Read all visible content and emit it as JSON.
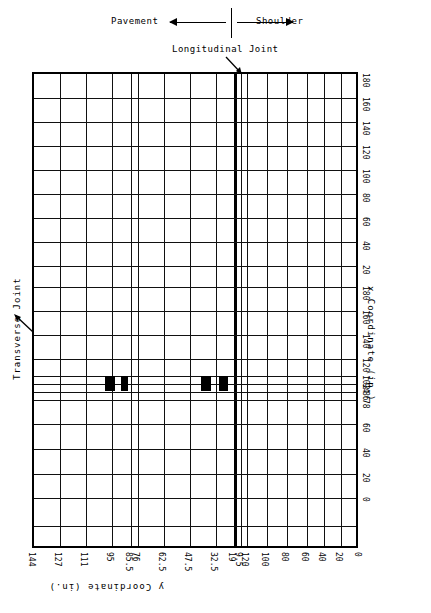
{
  "header": {
    "pavement_label": "Pavement",
    "shoulder_label": "Shoulder",
    "longitudinal_joint_label": "Longitudinal Joint"
  },
  "annotations": {
    "transverse_joint_label": "Transverse Joint"
  },
  "axes": {
    "x_axis_title": "x Coordinate (in.)",
    "y_axis_title": "y Coordinate (in.)"
  },
  "chart_data": {
    "type": "heatmap",
    "title": "",
    "subtitle": "",
    "xlabel": "y Coordinate (in.)",
    "ylabel": "x Coordinate (in.)",
    "grid": true,
    "legend_position": "none",
    "orientation": "rotated-180",
    "x_tick_labels": [
      "144",
      "127",
      "111",
      "95",
      "85.5",
      "76",
      "62.5",
      "47.5",
      "32.5",
      "19",
      "9.5",
      "120",
      "100",
      "80",
      "60",
      "40",
      "20",
      "0"
    ],
    "y_tick_labels": [
      "180",
      "160",
      "140",
      "120",
      "100",
      "80",
      "60",
      "40",
      "20",
      "180",
      "160",
      "140",
      "120",
      "102",
      "94",
      "86",
      "78",
      "60",
      "40",
      "20",
      "0"
    ],
    "x_tick_positions": [
      0,
      26,
      52,
      78,
      97,
      104,
      130,
      156,
      182,
      200,
      207,
      213,
      233,
      253,
      273,
      290,
      307,
      326
    ],
    "y_tick_positions": [
      0,
      24,
      48,
      72,
      96,
      120,
      144,
      168,
      192,
      213,
      237,
      261,
      285,
      302,
      310,
      318,
      326,
      350,
      375,
      400,
      424
    ],
    "joints": {
      "longitudinal_joint_x": 200,
      "transverse_joint_y": 249
    },
    "marked_cells": [
      {
        "name": "defect-1",
        "x": 71,
        "y": 302,
        "w": 10,
        "h": 15
      },
      {
        "name": "defect-2",
        "x": 87,
        "y": 302,
        "w": 7,
        "h": 15
      },
      {
        "name": "defect-3",
        "x": 167,
        "y": 302,
        "w": 10,
        "h": 15
      },
      {
        "name": "defect-4",
        "x": 185,
        "y": 302,
        "w": 9,
        "h": 15
      }
    ],
    "vertical_gridlines": [
      0,
      26,
      52,
      78,
      97,
      104,
      130,
      156,
      182,
      200,
      207,
      213,
      233,
      253,
      273,
      290,
      307,
      326
    ],
    "horizontal_gridlines": [
      0,
      24,
      48,
      72,
      96,
      120,
      144,
      168,
      192,
      213,
      237,
      261,
      285,
      302,
      310,
      318,
      326,
      350,
      375,
      400,
      424,
      452,
      476
    ]
  },
  "colors": {
    "line": "#111111",
    "joint": "#000000",
    "mark": "#000000",
    "background": "#ffffff"
  }
}
